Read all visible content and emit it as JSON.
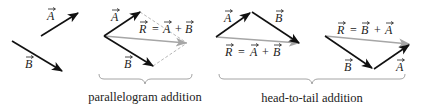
{
  "colors": {
    "vector": "#111111",
    "resultant": "#a6a6a6",
    "dashed": "#b8b8b8",
    "brace": "#9a9a9a",
    "text": "#222222"
  },
  "panels": [
    {
      "id": "separate-vectors",
      "labels": {
        "a": "A",
        "b": "B"
      }
    },
    {
      "id": "parallelogram",
      "labels": {
        "a": "A",
        "b": "B",
        "r": "R",
        "eq": "= A + B",
        "eq_lhs": "R",
        "eq_op": "=",
        "eq_term1": "A",
        "eq_plus": "+",
        "eq_term2": "B"
      }
    },
    {
      "id": "head-to-tail-ab",
      "labels": {
        "a": "A",
        "b": "B",
        "eq_lhs": "R",
        "eq_op": "=",
        "eq_term1": "A",
        "eq_plus": "+",
        "eq_term2": "B"
      }
    },
    {
      "id": "head-to-tail-ba",
      "labels": {
        "a": "A",
        "b": "B",
        "eq_lhs": "R",
        "eq_op": "=",
        "eq_term1": "B",
        "eq_plus": "+",
        "eq_term2": "A"
      }
    }
  ],
  "captions": {
    "parallelogram": "parallelogram addition",
    "head_to_tail": "head-to-tail addition"
  }
}
